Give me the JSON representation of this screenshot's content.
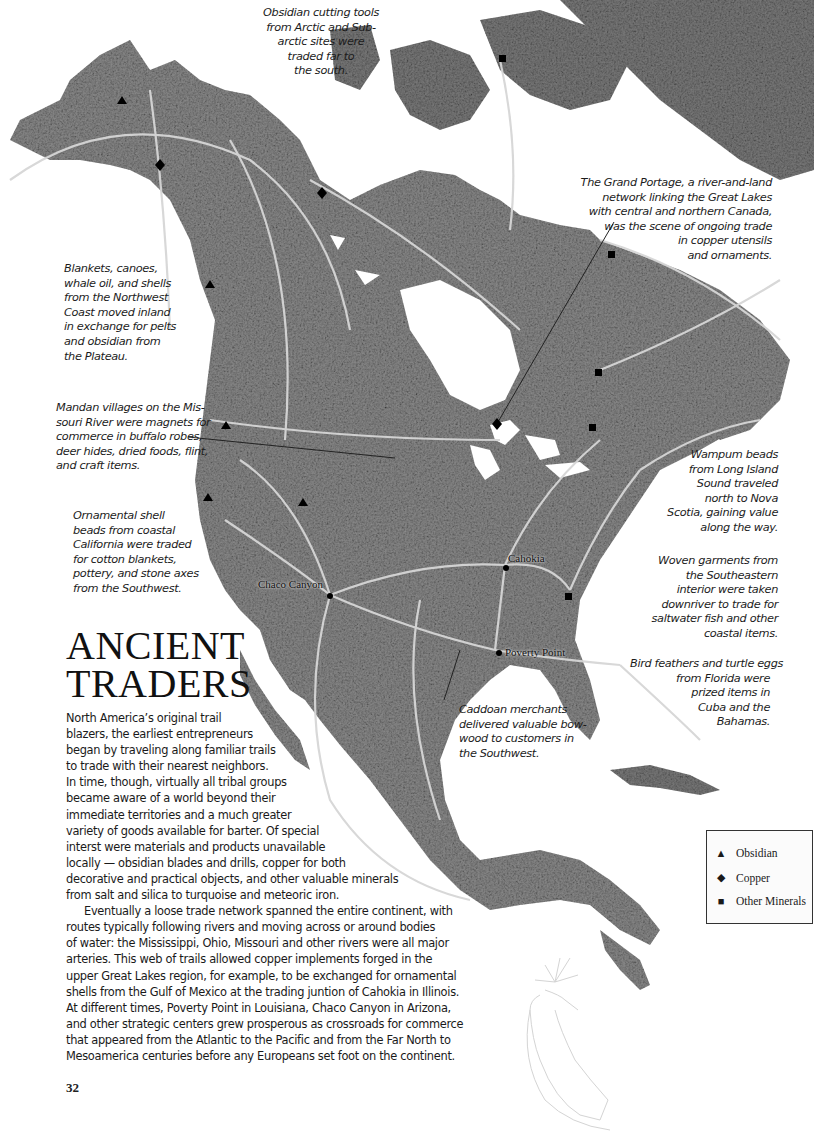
{
  "page": {
    "title_lines": [
      "ANCIENT",
      "TRADERS"
    ],
    "page_number": "32"
  },
  "body_text": {
    "lines": [
      "North America’s original trail",
      "blazers, the earliest entrepreneurs",
      "began by traveling along familiar trails",
      "to trade with their nearest neighbors.",
      "In time, though, virtually all tribal groups",
      "became aware of a world beyond their",
      "immediate territories and a much greater",
      "variety of goods available for barter. Of special",
      "interst were materials and products unavailable",
      "locally — obsidian blades and drills, copper for both",
      "decorative and practical objects, and other valuable minerals",
      "from salt and silica to turquoise and meteoric iron.",
      "Eventually a loose trade network spanned the entire continent, with",
      "routes typically following rivers and moving across or around bodies",
      "of water: the Mississippi, Ohio, Missouri and other rivers were all major",
      "arteries. This web of trails allowed copper implements forged in the",
      "upper Great Lakes region, for example, to be exchanged for ornamental",
      "shells from the Gulf of Mexico at the trading juntion of Cahokia in Illinois.",
      "At different times, Poverty Point in Louisiana, Chaco Canyon in Arizona,",
      "and other strategic centers grew prosperous as crossroads for commerce",
      "that appeared from the Atlantic to the Pacific and from the Far North to",
      "Mesoamerica centuries before any Europeans set foot on the continent."
    ]
  },
  "callouts": {
    "obsidian_arctic": [
      "Obsidian cutting tools",
      "from Arctic and Sub-",
      "arctic sites were",
      "traded far to",
      "the south."
    ],
    "grand_portage": [
      "The Grand Portage, a river-and-land",
      "network linking the Great Lakes",
      "with central and northern Canada,",
      "was the scene of ongoing trade",
      "in copper utensils",
      "and ornaments."
    ],
    "northwest_coast": [
      "Blankets, canoes,",
      "whale oil, and shells",
      "from the Northwest",
      "Coast moved inland",
      "in exchange for pelts",
      "and obsidian from",
      "the Plateau."
    ],
    "mandan": [
      "Mandan villages on the Mis-",
      "souri River were magnets for",
      "commerce in buffalo robes,",
      "deer hides, dried foods, flint,",
      "and craft items."
    ],
    "california_shell": [
      "Ornamental shell",
      "beads from coastal",
      "California were traded",
      "for cotton blankets,",
      "pottery, and stone axes",
      "from the Southwest."
    ],
    "wampum": [
      "Wampum beads",
      "from Long Island",
      "Sound traveled",
      "north to Nova",
      "Scotia, gaining value",
      "along the way."
    ],
    "woven_garments": [
      "Woven garments from",
      "the Southeastern",
      "interior were taken",
      "downriver to trade for",
      "saltwater fish and other",
      "coastal items."
    ],
    "bird_feathers": [
      "Bird feathers and turtle eggs",
      "from Florida were",
      "prized items in",
      "Cuba and the",
      "Bahamas."
    ],
    "caddoan": [
      "Caddoan merchants",
      "delivered valuable bow-",
      "wood to customers in",
      "the Southwest."
    ]
  },
  "map": {
    "land_color": "#6e6e6e",
    "route_color": "#d9d9d9",
    "cities": [
      {
        "name": "Cahokia"
      },
      {
        "name": "Chaco Canyon"
      },
      {
        "name": "Poverty Point"
      }
    ],
    "markers": {
      "obsidian": 5,
      "copper": 3,
      "other_minerals": 6
    }
  },
  "legend": {
    "items": [
      {
        "symbol": "▲",
        "label": "Obsidian",
        "icon": "triangle-icon"
      },
      {
        "symbol": "◆",
        "label": "Copper",
        "icon": "diamond-icon"
      },
      {
        "symbol": "■",
        "label": "Other Minerals",
        "icon": "square-icon"
      }
    ]
  }
}
